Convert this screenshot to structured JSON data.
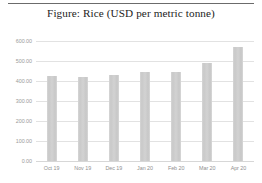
{
  "figure": {
    "title": "Figure: Rice (USD per metric tonne)"
  },
  "chart_data": {
    "type": "bar",
    "title": "Figure: Rice (USD per metric tonne)",
    "xlabel": "",
    "ylabel": "",
    "ylim": [
      0,
      600
    ],
    "grid": true,
    "legend": "none",
    "y_ticks": [
      "0.00",
      "100.00",
      "200.00",
      "300.00",
      "400.00",
      "500.00",
      "600.00"
    ],
    "y_tick_values": [
      0,
      100,
      200,
      300,
      400,
      500,
      600
    ],
    "categories": [
      "Oct 19",
      "Nov 19",
      "Dec 19",
      "Jan 20",
      "Feb 20",
      "Mar 20",
      "Apr 20"
    ],
    "values": [
      425,
      420,
      430,
      445,
      445,
      490,
      570
    ],
    "bar_color": "#d0d0d0",
    "gridline_color": "#e2e2e2",
    "tick_label_color": "#9a9a9a"
  }
}
